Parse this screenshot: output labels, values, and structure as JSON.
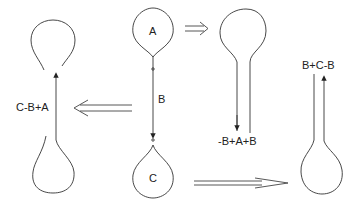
{
  "diagram": {
    "center": {
      "loop_top_label": "A",
      "stem_label": "B",
      "loop_bottom_label": "C"
    },
    "left": {
      "label": "C-B+A"
    },
    "upper_right": {
      "label": "-B+A+B"
    },
    "lower_right": {
      "label": "B+C-B"
    },
    "colors": {
      "stroke": "#333333",
      "background": "#ffffff"
    }
  }
}
